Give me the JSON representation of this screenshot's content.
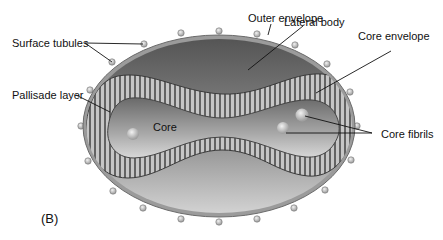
{
  "figure": {
    "panel_label": "(B)",
    "labels": {
      "outer_envelope": "Outer envelope",
      "lateral_body": "Lateral body",
      "surface_tubules": "Surface tubules",
      "core_envelope": "Core envelope",
      "pallisade_layer": "Pallisade layer",
      "core": "Core",
      "core_fibrils": "Core fibrils"
    },
    "colors": {
      "envelope_ring": "#9a9a9a",
      "lateral_body": "#6e6e6e",
      "lateral_body_light": "#bdbdbd",
      "pallisade_bar": "#c8c8c8",
      "pallisade_gap": "#4a4a4a",
      "core": "#8a8a8a",
      "core_light": "#cfcfcf",
      "tubule": "#a8a8a8"
    }
  }
}
